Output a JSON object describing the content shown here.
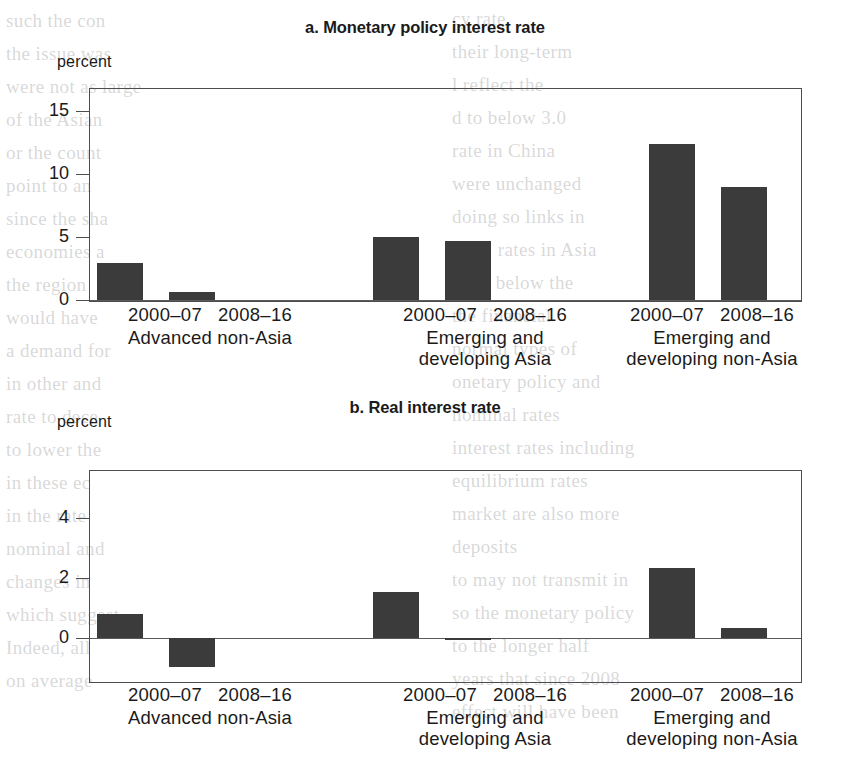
{
  "page": {
    "width": 850,
    "height": 761,
    "background": "#ffffff",
    "bar_color": "#3b3b3b",
    "axis_color": "#4d4d4d"
  },
  "bleed_text": {
    "note": "faint show-through text from the reverse side of the printed page",
    "left_column": [
      "such the con",
      "the issue was",
      "were not as large",
      "of the Asian",
      "or the count",
      "point to an",
      "since the sha",
      "economies a",
      "the region",
      "would have",
      "a demand for",
      "in other and",
      "rate to dece",
      "to lower the",
      "in these ec",
      "in the rate",
      "nominal and",
      "changes in",
      "which suggest",
      "Indeed, all",
      "on average"
    ],
    "right_column": [
      "cy rate",
      "their long-term",
      "l reflect the",
      "d to below 3.0",
      "rate in China",
      "were unchanged",
      "doing so links in",
      "time, rates in Asia",
      "were below the",
      "the financial",
      "normal types of",
      "onetary policy and",
      "nominal rates",
      "interest rates including",
      "equilibrium rates",
      "market are also more",
      "deposits",
      "to may not transmit in",
      "so the monetary policy",
      "to the longer half",
      "years that since 2008",
      "effect will have been"
    ]
  },
  "charts": [
    {
      "id": "panel-a",
      "letter": "a.",
      "title": "a. Monetary policy interest rate",
      "unit_label": "percent",
      "chart_data": {
        "type": "bar",
        "title": "a. Monetary policy interest rate",
        "xlabel": "",
        "ylabel": "percent",
        "ylim": [
          0,
          16.8
        ],
        "yticks": [
          0,
          5,
          10,
          15
        ],
        "ytick_labels": [
          "0",
          "5",
          "10",
          "15"
        ],
        "grid": false,
        "legend": "none",
        "categories": [
          "Advanced non-Asia 2000–07",
          "Advanced non-Asia 2008–16",
          "Emerging and developing Asia 2000–07",
          "Emerging and developing Asia 2008–16",
          "Emerging and developing non-Asia 2000–07",
          "Emerging and developing non-Asia 2008–16"
        ],
        "values": [
          2.9,
          0.6,
          5.0,
          4.7,
          12.4,
          9.0
        ]
      },
      "groups": [
        {
          "region": "Advanced non-Asia",
          "region_lines": "Advanced non-Asia",
          "bars": [
            {
              "period": "2000–07",
              "value": 2.9
            },
            {
              "period": "2008–16",
              "value": 0.6
            }
          ]
        },
        {
          "region": "Emerging and developing Asia",
          "region_lines": "Emerging and\ndeveloping Asia",
          "bars": [
            {
              "period": "2000–07",
              "value": 5.0
            },
            {
              "period": "2008–16",
              "value": 4.7
            }
          ]
        },
        {
          "region": "Emerging and developing non-Asia",
          "region_lines": "Emerging and\ndeveloping non-Asia",
          "bars": [
            {
              "period": "2000–07",
              "value": 12.4
            },
            {
              "period": "2008–16",
              "value": 9.0
            }
          ]
        }
      ]
    },
    {
      "id": "panel-b",
      "letter": "b.",
      "title": "b. Real interest rate",
      "unit_label": "percent",
      "chart_data": {
        "type": "bar",
        "title": "b. Real interest rate",
        "xlabel": "",
        "ylabel": "percent",
        "ylim": [
          -1.45,
          5.6
        ],
        "yticks": [
          0,
          2,
          4
        ],
        "ytick_labels": [
          "0",
          "2",
          "4"
        ],
        "grid": false,
        "legend": "none",
        "categories": [
          "Advanced non-Asia 2000–07",
          "Advanced non-Asia 2008–16",
          "Emerging and developing Asia 2000–07",
          "Emerging and developing Asia 2008–16",
          "Emerging and developing non-Asia 2000–07",
          "Emerging and developing non-Asia 2008–16"
        ],
        "values": [
          0.8,
          -0.95,
          1.55,
          -0.05,
          2.35,
          0.35
        ]
      },
      "groups": [
        {
          "region": "Advanced non-Asia",
          "region_lines": "Advanced non-Asia",
          "bars": [
            {
              "period": "2000–07",
              "value": 0.8
            },
            {
              "period": "2008–16",
              "value": -0.95
            }
          ]
        },
        {
          "region": "Emerging and developing Asia",
          "region_lines": "Emerging and\ndeveloping Asia",
          "bars": [
            {
              "period": "2000–07",
              "value": 1.55
            },
            {
              "period": "2008–16",
              "value": -0.05
            }
          ]
        },
        {
          "region": "Emerging and developing non-Asia",
          "region_lines": "Emerging and\ndeveloping non-Asia",
          "bars": [
            {
              "period": "2000–07",
              "value": 2.35
            },
            {
              "period": "2008–16",
              "value": 0.35
            }
          ]
        }
      ]
    }
  ]
}
